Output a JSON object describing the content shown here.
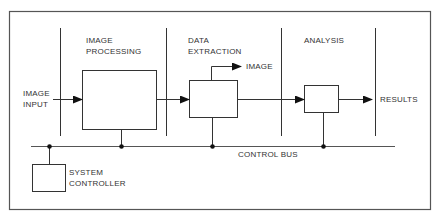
{
  "diagram": {
    "type": "block-diagram",
    "sections": [
      {
        "id": "image-processing",
        "title_line1": "IMAGE",
        "title_line2": "PROCESSING"
      },
      {
        "id": "data-extraction",
        "title_line1": "DATA",
        "title_line2": "EXTRACTION"
      },
      {
        "id": "analysis",
        "title_line1": "ANALYSIS"
      }
    ],
    "input": {
      "line1": "IMAGE",
      "line2": "INPUT"
    },
    "output": {
      "label": "RESULTS"
    },
    "image_output": {
      "label": "IMAGE"
    },
    "bus": {
      "label": "CONTROL BUS"
    },
    "controller": {
      "line1": "SYSTEM",
      "line2": "CONTROLLER"
    },
    "colors": {
      "line": "#333333",
      "border": "#555555",
      "background": "#ffffff"
    }
  }
}
